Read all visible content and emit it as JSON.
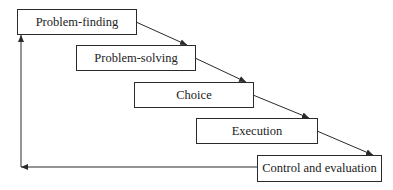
{
  "diagram": {
    "type": "process-flow",
    "steps": [
      {
        "label": "Problem-finding"
      },
      {
        "label": "Problem-solving"
      },
      {
        "label": "Choice"
      },
      {
        "label": "Execution"
      },
      {
        "label": "Control and evaluation"
      }
    ],
    "feedback": {
      "from": "Control and evaluation",
      "to": "Problem-finding"
    },
    "colors": {
      "line": "#2a2a2a",
      "background": "#ffffff"
    }
  }
}
